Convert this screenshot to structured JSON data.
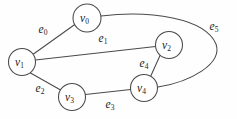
{
  "figure": {
    "background_color": "#fefefe",
    "stroke_color": "#4a4a4a",
    "text_color": "#1c1c1c"
  },
  "graph_data": {
    "type": "diagram",
    "graph_type": "undirected",
    "vertex_count": 5,
    "edge_count": 6,
    "vertices": [
      {
        "id": "v0",
        "base": "v",
        "sub": "0",
        "cx": 87,
        "cy": 18,
        "r": 14
      },
      {
        "id": "v1",
        "base": "v",
        "sub": "1",
        "cx": 22,
        "cy": 62,
        "r": 13.5
      },
      {
        "id": "v2",
        "base": "v",
        "sub": "2",
        "cx": 169,
        "cy": 45,
        "r": 13.5
      },
      {
        "id": "v3",
        "base": "v",
        "sub": "3",
        "cx": 72,
        "cy": 97,
        "r": 13.5
      },
      {
        "id": "v4",
        "base": "v",
        "sub": "4",
        "cx": 144,
        "cy": 88,
        "r": 13.5
      }
    ],
    "edges": [
      {
        "id": "e0",
        "base": "e",
        "sub": "0",
        "from": "v1",
        "to": "v0",
        "label_x": 43,
        "label_y": 29,
        "path": "M 33.5 54 L 75.5 24"
      },
      {
        "id": "e1",
        "base": "e",
        "sub": "1",
        "from": "v1",
        "to": "v2",
        "label_x": 103,
        "label_y": 38,
        "path": "M 35.4 60 L 155.6 46.6"
      },
      {
        "id": "e2",
        "base": "e",
        "sub": "2",
        "from": "v1",
        "to": "v3",
        "label_x": 40,
        "label_y": 88,
        "path": "M 30.5 73 L 61.5 90.5"
      },
      {
        "id": "e3",
        "base": "e",
        "sub": "3",
        "from": "v3",
        "to": "v4",
        "label_x": 110,
        "label_y": 104,
        "path": "M 85.4 94.6 L 130.6 89.6"
      },
      {
        "id": "e4",
        "base": "e",
        "sub": "4",
        "from": "v2",
        "to": "v4",
        "label_x": 144,
        "label_y": 63,
        "path": "M 160 55.5 L 151 75.5"
      },
      {
        "id": "e5",
        "base": "e",
        "sub": "5",
        "from": "v0",
        "to": "v4",
        "label_x": 214,
        "label_y": 26,
        "path": "M 101 16 C 150 10, 205 18, 216 44 C 223 64, 190 82, 158 87"
      }
    ]
  }
}
